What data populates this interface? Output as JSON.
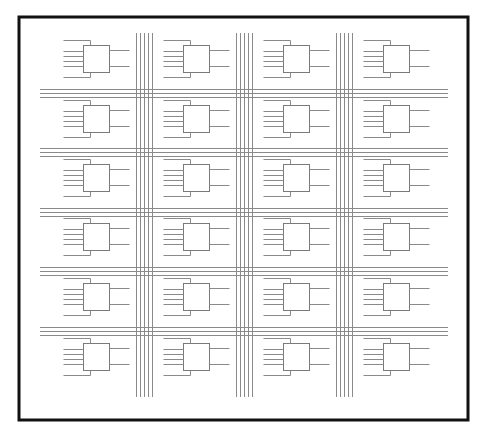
{
  "diagram": {
    "title": "",
    "type": "island-style FPGA routing architecture",
    "colors": {
      "background": "#ffffff",
      "border": "#111111",
      "wire": "#8a8a8a",
      "block": "#7a7a7a"
    },
    "border": {
      "x": 19,
      "y": 17,
      "width": 449,
      "height": 403,
      "stroke_width": 3
    },
    "grid": {
      "columns": 4,
      "rows": 6,
      "block_size": [
        26,
        27
      ],
      "column_block_x": [
        83,
        183,
        283,
        383
      ],
      "row_block_y": [
        45,
        105,
        164,
        223,
        283,
        343
      ]
    },
    "logic_block": {
      "inputs": 6,
      "outputs": 2,
      "input_stub_length": 20,
      "output_stub_length": 20
    },
    "vertical_channels": [
      {
        "x_start": 136,
        "tracks": 5,
        "spacing": 4,
        "y_top": 33,
        "y_bottom": 397
      },
      {
        "x_start": 236,
        "tracks": 5,
        "spacing": 4,
        "y_top": 33,
        "y_bottom": 397
      },
      {
        "x_start": 336,
        "tracks": 5,
        "spacing": 4,
        "y_top": 33,
        "y_bottom": 397
      }
    ],
    "horizontal_channels": [
      {
        "y_start": 89,
        "tracks": 3,
        "spacing": 4,
        "x_left": 40,
        "x_right": 448
      },
      {
        "y_start": 148,
        "tracks": 3,
        "spacing": 4,
        "x_left": 40,
        "x_right": 448
      },
      {
        "y_start": 208,
        "tracks": 3,
        "spacing": 4,
        "x_left": 40,
        "x_right": 448
      },
      {
        "y_start": 267,
        "tracks": 3,
        "spacing": 4,
        "x_left": 40,
        "x_right": 448
      },
      {
        "y_start": 327,
        "tracks": 3,
        "spacing": 4,
        "x_left": 40,
        "x_right": 448
      }
    ]
  }
}
